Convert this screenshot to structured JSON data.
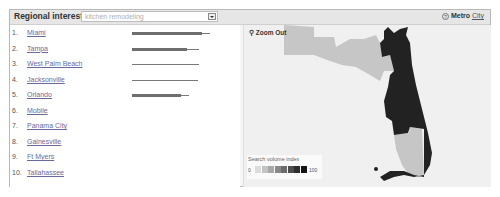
{
  "header": {
    "title": "Regional interest",
    "query_select": {
      "value": "kitchen remodeling"
    },
    "view_mode": {
      "help_icon": "question-circle-icon",
      "active": "Metro",
      "other": "City"
    }
  },
  "list": {
    "items": [
      {
        "rank": "1.",
        "city": "Miami",
        "bar_thick": 70,
        "bar_line": 78
      },
      {
        "rank": "2.",
        "city": "Tampa",
        "bar_thick": 55,
        "bar_line": 67
      },
      {
        "rank": "3.",
        "city": "West Palm Beach",
        "bar_thick": 0,
        "bar_line": 67
      },
      {
        "rank": "4.",
        "city": "Jacksonville",
        "bar_thick": 0,
        "bar_line": 66
      },
      {
        "rank": "5.",
        "city": "Orlando",
        "bar_thick": 49,
        "bar_line": 57
      },
      {
        "rank": "6.",
        "city": "Mobile",
        "bar_thick": 0,
        "bar_line": 0
      },
      {
        "rank": "7.",
        "city": "Panama City",
        "bar_thick": 0,
        "bar_line": 0
      },
      {
        "rank": "8.",
        "city": "Gainesville",
        "bar_thick": 0,
        "bar_line": 0
      },
      {
        "rank": "9.",
        "city": "Ft Myers",
        "bar_thick": 0,
        "bar_line": 0
      },
      {
        "rank": "10.",
        "city": "Tallahassee",
        "bar_thick": 0,
        "bar_line": 0
      }
    ]
  },
  "map": {
    "zoom_out_label": "Zoom Out",
    "zoom_icon": "magnifier-minus-icon",
    "legend": {
      "title": "Search volume index",
      "min": "0",
      "max": "100",
      "scale_colors": [
        "#dcdcdc",
        "#c4c4c4",
        "#a8a8a8",
        "#8a8a8a",
        "#6c6c6c",
        "#4e4e4e",
        "#2e2e2e",
        "#141414"
      ]
    },
    "region_colors": {
      "high": "#222222",
      "low": "#c8c8c8",
      "none": "#ededed"
    }
  }
}
